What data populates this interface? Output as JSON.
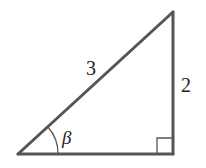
{
  "diagram": {
    "type": "right-triangle",
    "hypotenuse_label": "3",
    "vertical_side_label": "2",
    "angle_label": "β",
    "right_angle_marker": true,
    "stroke_color": "#555555",
    "text_color": "#222222"
  }
}
